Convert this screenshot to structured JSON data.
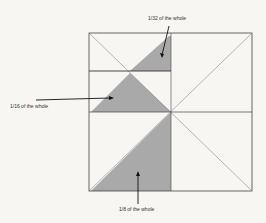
{
  "diagram": {
    "type": "fraction-square",
    "labels": {
      "top": "1/32 of the whole",
      "middle": "1/16 of the whole",
      "bottom": "1/8 of the whole"
    },
    "colors": {
      "shade": "#a9a9a9",
      "line": "#444444",
      "background": "#f7f6f3"
    }
  }
}
